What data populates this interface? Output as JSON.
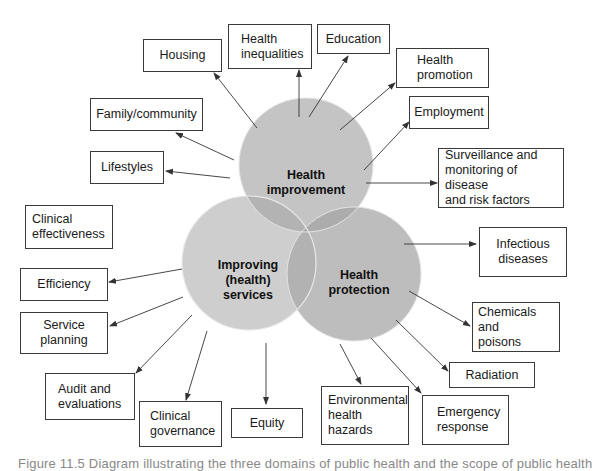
{
  "diagram": {
    "colors": {
      "circle_fill": "#c4c4c4",
      "overlap_fill": "#a9a9a9",
      "circle_edge": "#e6e6e6",
      "box_border": "#3a3a3a",
      "arrow": "#333333"
    },
    "circles": {
      "health_improvement": {
        "label": "Health\nimprovement"
      },
      "improving_services": {
        "label": "Improving\n(health)\nservices"
      },
      "health_protection": {
        "label": "Health\nprotection"
      }
    },
    "boxes": {
      "housing": "Housing",
      "health_inequalities": "Health\ninequalities",
      "education": "Education",
      "health_promotion": "Health\npromotion",
      "family_community": "Family/community",
      "employment": "Employment",
      "lifestyles": "Lifestyles",
      "surveillance": "Surveillance and\nmonitoring of disease\nand risk factors",
      "clinical_effectiveness": "Clinical\neffectiveness",
      "infectious_diseases": "Infectious\ndiseases",
      "efficiency": "Efficiency",
      "service_planning": "Service\nplanning",
      "chemicals_poisons": "Chemicals and\npoisons",
      "radiation": "Radiation",
      "audit_evaluations": "Audit and\nevaluations",
      "clinical_governance": "Clinical\ngovernance",
      "equity": "Equity",
      "environmental_hazards": "Environmental\nhealth\nhazards",
      "emergency_response": "Emergency\nresponse"
    },
    "caption": "Figure 11.5   Diagram illustrating the three domains of public health and the scope of public health"
  }
}
